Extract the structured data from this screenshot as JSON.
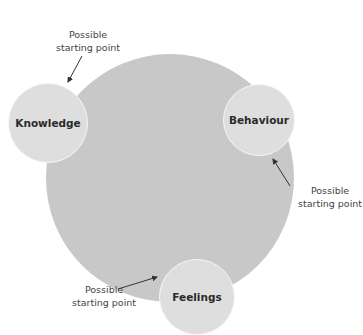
{
  "diagram": {
    "colors": {
      "big_circle": "#c8c8c8",
      "small_circle": "#dedede",
      "text": "#2a2a2a",
      "arrow": "#333333"
    },
    "nodes": [
      {
        "label": "Knowledge",
        "cx": 48,
        "cy": 123,
        "r": 40
      },
      {
        "label": "Behaviour",
        "cx": 259,
        "cy": 120,
        "r": 36
      },
      {
        "label": "Feelings",
        "cx": 197,
        "cy": 297,
        "r": 38
      }
    ],
    "annotations": [
      {
        "line1": "Possible",
        "line2": "starting point"
      },
      {
        "line1": "Possible",
        "line2": "starting point"
      },
      {
        "line1": "Possible",
        "line2": "starting point"
      }
    ]
  }
}
